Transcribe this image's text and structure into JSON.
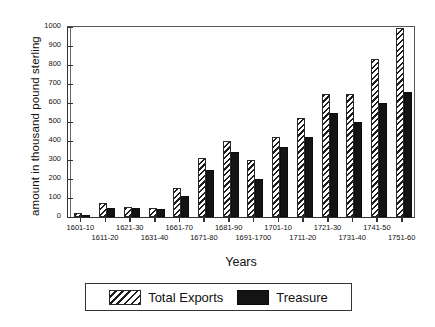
{
  "chart_data": {
    "type": "bar",
    "title": "",
    "xlabel": "Years",
    "ylabel": "amount in thousand pound sterling",
    "ylim": [
      0,
      1000
    ],
    "yticks": [
      0,
      100,
      200,
      300,
      400,
      500,
      600,
      700,
      800,
      900,
      1000
    ],
    "ytick_labels": [
      "0",
      "100",
      "200",
      "300",
      "400",
      "500",
      "600",
      "700",
      "800",
      "900",
      "1000"
    ],
    "grid": false,
    "legend_position": "bottom",
    "categories": [
      "1601-10",
      "1611-20",
      "1621-30",
      "1631-40",
      "1661-70",
      "1671-80",
      "1681-90",
      "1691-1700",
      "1701-10",
      "1711-20",
      "1721-30",
      "1731-40",
      "1741-50",
      "1751-60"
    ],
    "series": [
      {
        "name": "Total Exports",
        "fill": "diagonal-hatch",
        "color": "#1d1d1d",
        "values": [
          20,
          75,
          55,
          50,
          155,
          310,
          400,
          300,
          420,
          520,
          650,
          650,
          830,
          995
        ]
      },
      {
        "name": "Treasure",
        "fill": "solid",
        "color": "#141414",
        "values": [
          10,
          50,
          45,
          40,
          110,
          250,
          340,
          200,
          370,
          420,
          545,
          500,
          600,
          660
        ]
      }
    ]
  },
  "legend": {
    "items": [
      {
        "label": "Total Exports"
      },
      {
        "label": "Treasure"
      }
    ]
  }
}
